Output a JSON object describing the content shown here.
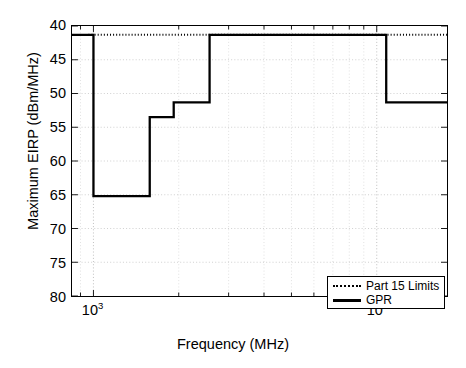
{
  "chart_data": {
    "type": "line",
    "title": "",
    "xlabel": "Frequency  (MHz)",
    "ylabel": "Maximum EIRP  (dBm/MHz)",
    "xscale": "log",
    "yscale": "linear",
    "y_inverted": true,
    "xlim": [
      840,
      17700
    ],
    "ylim": [
      40,
      80
    ],
    "yticks": [
      40,
      45,
      50,
      55,
      60,
      65,
      70,
      75,
      80
    ],
    "ytick_labels": [
      "40",
      "45",
      "50",
      "55",
      "60",
      "65",
      "70",
      "75",
      "80"
    ],
    "xticks": [
      1000,
      10000
    ],
    "xtick_labels": [
      "10",
      "10"
    ],
    "xtick_exponents": [
      "3",
      "4"
    ],
    "grid": true,
    "grid_style": "dotted",
    "legend_position": "lower right",
    "series": [
      {
        "name": "Part 15 Limits",
        "style": "dotted",
        "color": "#000000",
        "points": [
          {
            "f": 960,
            "eirp": 41.3
          },
          {
            "f": 17700,
            "eirp": 41.3
          }
        ]
      },
      {
        "name": "GPR",
        "style": "solid",
        "color": "#000000",
        "step_segments": [
          {
            "f_start": 840,
            "f_end": 1000,
            "eirp": 41.3
          },
          {
            "f_start": 1000,
            "f_end": 1580,
            "eirp": 65.2
          },
          {
            "f_start": 1580,
            "f_end": 1920,
            "eirp": 53.5
          },
          {
            "f_start": 1920,
            "f_end": 2570,
            "eirp": 51.3
          },
          {
            "f_start": 2570,
            "f_end": 10800,
            "eirp": 41.3
          },
          {
            "f_start": 10800,
            "f_end": 17700,
            "eirp": 51.3
          }
        ]
      }
    ]
  },
  "legend": {
    "items": [
      {
        "label": "Part 15 Limits",
        "style": "dotted"
      },
      {
        "label": "GPR",
        "style": "solid"
      }
    ]
  }
}
